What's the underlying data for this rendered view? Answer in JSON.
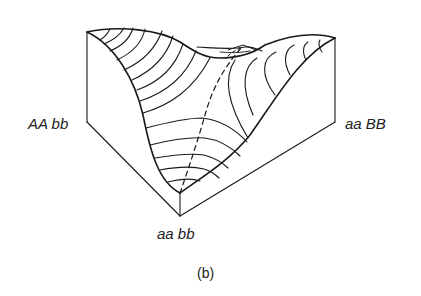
{
  "figure": {
    "caption": "(b)",
    "type": "3D fitness landscape block diagram with contour lines",
    "corner_labels": {
      "left": "AA bb",
      "right": "aa BB",
      "front": "aa bb"
    },
    "colors": {
      "line": "#1a1a1a",
      "background": "#ffffff"
    }
  }
}
